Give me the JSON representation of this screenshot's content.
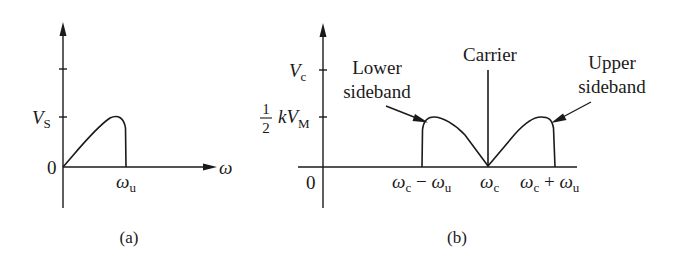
{
  "panel_a": {
    "caption": "(a)",
    "y_tick_label_main": "V",
    "y_tick_label_sub": "S",
    "origin_label": "0",
    "x_axis_label": "ω",
    "x_tick_main": "ω",
    "x_tick_sub": "u"
  },
  "panel_b": {
    "caption": "(b)",
    "y_tick_vc_main": "V",
    "y_tick_vc_sub": "c",
    "y_tick_half_num": "1",
    "y_tick_half_den": "2",
    "y_tick_half_k": "kV",
    "y_tick_half_sub": "M",
    "origin_label": "0",
    "carrier_label": "Carrier",
    "lower_line1": "Lower",
    "lower_line2": "sideband",
    "upper_line1": "Upper",
    "upper_line2": "sideband",
    "x_lower_w1": "ω",
    "x_lower_c": "c",
    "x_lower_minus": " − ",
    "x_lower_w2": "ω",
    "x_lower_u": "u",
    "x_center_w": "ω",
    "x_center_c": "c",
    "x_upper_w1": "ω",
    "x_upper_c": "c",
    "x_upper_plus": " + ",
    "x_upper_w2": "ω",
    "x_upper_u": "u"
  },
  "colors": {
    "ink": "#1a1a1a",
    "background": "#ffffff"
  }
}
